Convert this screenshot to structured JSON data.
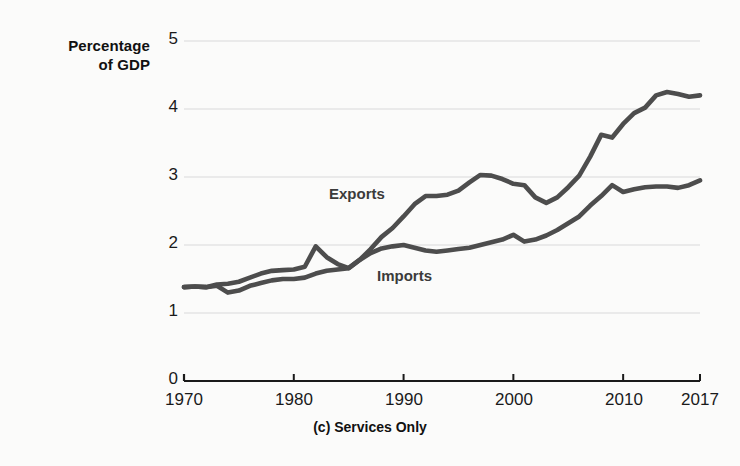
{
  "caption": "(c) Services Only",
  "axis": {
    "y_title_line1": "Percentage",
    "y_title_line2": "of GDP",
    "y_ticks": [
      "0",
      "1",
      "2",
      "3",
      "4",
      "5"
    ],
    "x_ticks": [
      "1970",
      "1980",
      "1990",
      "2000",
      "2010",
      "2017"
    ]
  },
  "labels": {
    "exports": "Exports",
    "imports": "Imports"
  },
  "colors": {
    "line": "#4d4d4d",
    "axis": "#1a1a1a",
    "grid": "#d9d9d9",
    "background": "#fbfbfa"
  },
  "chart_data": {
    "type": "line",
    "title": "(c) Services Only",
    "xlabel": "",
    "ylabel": "Percentage of GDP",
    "xlim": [
      1970,
      2017
    ],
    "ylim": [
      0,
      5
    ],
    "yticks": [
      0,
      1,
      2,
      3,
      4,
      5
    ],
    "xticks": [
      1970,
      1980,
      1990,
      2000,
      2010,
      2017
    ],
    "grid": "horizontal",
    "legend": "inline-annotations",
    "x": [
      1970,
      1971,
      1972,
      1973,
      1974,
      1975,
      1976,
      1977,
      1978,
      1979,
      1980,
      1981,
      1982,
      1983,
      1984,
      1985,
      1986,
      1987,
      1988,
      1989,
      1990,
      1991,
      1992,
      1993,
      1994,
      1995,
      1996,
      1997,
      1998,
      1999,
      2000,
      2001,
      2002,
      2003,
      2004,
      2005,
      2006,
      2007,
      2008,
      2009,
      2010,
      2011,
      2012,
      2013,
      2014,
      2015,
      2016,
      2017
    ],
    "series": [
      {
        "name": "Exports",
        "values": [
          1.38,
          1.39,
          1.38,
          1.42,
          1.43,
          1.46,
          1.52,
          1.58,
          1.62,
          1.63,
          1.64,
          1.68,
          1.98,
          1.82,
          1.72,
          1.66,
          1.78,
          1.94,
          2.12,
          2.25,
          2.42,
          2.6,
          2.72,
          2.72,
          2.74,
          2.8,
          2.92,
          3.03,
          3.02,
          2.97,
          2.9,
          2.88,
          2.7,
          2.62,
          2.7,
          2.85,
          3.02,
          3.3,
          3.62,
          3.58,
          3.78,
          3.94,
          4.02,
          4.2,
          4.25,
          4.22,
          4.18,
          4.2
        ]
      },
      {
        "name": "Imports",
        "values": [
          1.38,
          1.39,
          1.38,
          1.4,
          1.3,
          1.33,
          1.4,
          1.44,
          1.48,
          1.5,
          1.5,
          1.52,
          1.58,
          1.62,
          1.64,
          1.66,
          1.78,
          1.88,
          1.95,
          1.98,
          2.0,
          1.96,
          1.92,
          1.9,
          1.92,
          1.94,
          1.96,
          2.0,
          2.04,
          2.08,
          2.15,
          2.05,
          2.08,
          2.14,
          2.22,
          2.32,
          2.42,
          2.58,
          2.72,
          2.88,
          2.78,
          2.82,
          2.85,
          2.86,
          2.86,
          2.84,
          2.88,
          2.95
        ]
      }
    ]
  }
}
